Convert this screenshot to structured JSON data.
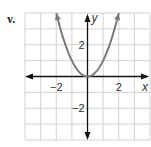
{
  "problem_label": "v.",
  "colors": {
    "grid": "#c8c8c8",
    "axis": "#111111",
    "curve": "#7a7a7a",
    "background": "#ffffff"
  },
  "chart_data": {
    "type": "line",
    "title": "",
    "function": "y = x^2",
    "xlabel": "x",
    "ylabel": "y",
    "xlim": [
      -4,
      4
    ],
    "ylim": [
      -4,
      4
    ],
    "grid": true,
    "x_ticks": [
      {
        "value": -2,
        "label": "−2"
      },
      {
        "value": 2,
        "label": "2"
      }
    ],
    "y_ticks": [
      {
        "value": 2,
        "label": "2"
      },
      {
        "value": -2,
        "label": "−2"
      }
    ],
    "series": [
      {
        "name": "parabola",
        "x": [
          -2,
          -1.5,
          -1,
          -0.5,
          0,
          0.5,
          1,
          1.5,
          2
        ],
        "y": [
          4,
          2.25,
          1,
          0.25,
          0,
          0.25,
          1,
          2.25,
          4
        ],
        "arrows_at_ends": true
      }
    ]
  }
}
